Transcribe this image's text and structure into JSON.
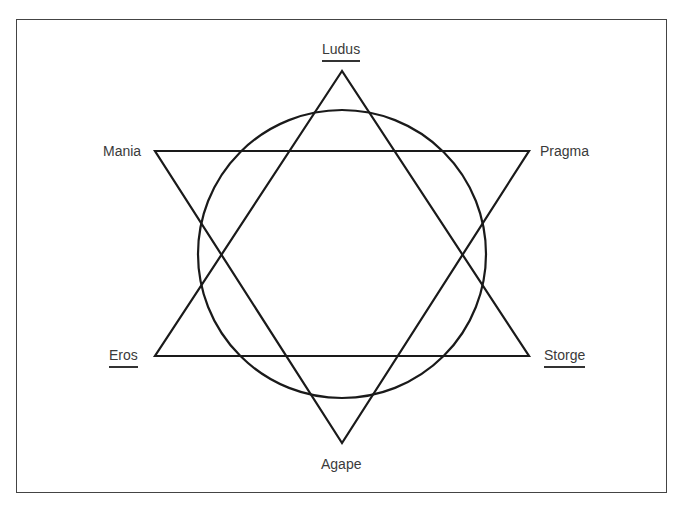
{
  "diagram": {
    "type": "hexagram-with-circle",
    "colors": {
      "stroke": "#1a1a1a",
      "label_text": "#3a3a3a",
      "frame": "#444444",
      "background": "#ffffff"
    },
    "nodes": [
      {
        "id": "ludus",
        "label": "Ludus",
        "position": "top",
        "underlined": true
      },
      {
        "id": "mania",
        "label": "Mania",
        "position": "upper-left",
        "underlined": false
      },
      {
        "id": "pragma",
        "label": "Pragma",
        "position": "upper-right",
        "underlined": false
      },
      {
        "id": "eros",
        "label": "Eros",
        "position": "lower-left",
        "underlined": true
      },
      {
        "id": "storge",
        "label": "Storge",
        "position": "lower-right",
        "underlined": true
      },
      {
        "id": "agape",
        "label": "Agape",
        "position": "bottom",
        "underlined": false
      }
    ],
    "triangles": [
      {
        "name": "upward-triangle",
        "vertices": [
          "Ludus",
          "Eros",
          "Storge"
        ]
      },
      {
        "name": "downward-triangle",
        "vertices": [
          "Mania",
          "Pragma",
          "Agape"
        ]
      }
    ],
    "center_shape": "circle"
  }
}
